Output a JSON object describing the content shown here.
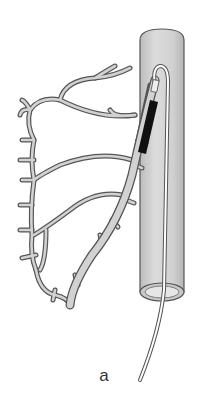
{
  "figure": {
    "panel_label": "a",
    "elements": [
      {
        "name": "aorta-cylinder",
        "description": "shaded grey vertical vessel with open bottom end"
      },
      {
        "name": "coronary-artery-tree",
        "description": "branching grey outlined vessels on the left"
      },
      {
        "name": "catheter",
        "description": "thin white tube entering from bottom, looping at top into the artery ostium"
      },
      {
        "name": "stent-balloon",
        "description": "black segment on catheter inside proximal artery"
      }
    ],
    "colors": {
      "vessel_fill": "#cfcfcf",
      "vessel_outline": "#555555",
      "cylinder_fill": "#d4d4d4",
      "cylinder_shade": "#bdbdbd",
      "stent": "#111111",
      "catheter": "#ffffff",
      "label": "#333333"
    }
  }
}
